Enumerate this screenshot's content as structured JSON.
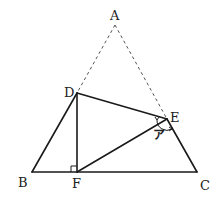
{
  "figure": {
    "type": "geometry-fold-diagram",
    "stroke_color": "#1a1a1a",
    "dashed_color": "#555555",
    "points": {
      "A": {
        "label": "A",
        "x": 115,
        "y": 25
      },
      "B": {
        "label": "B",
        "x": 32,
        "y": 172
      },
      "C": {
        "label": "C",
        "x": 197,
        "y": 172
      },
      "D": {
        "label": "D",
        "x": 77,
        "y": 93
      },
      "E": {
        "label": "E",
        "x": 167,
        "y": 119
      },
      "F": {
        "label": "F",
        "x": 77,
        "y": 172
      }
    },
    "solid_segments": [
      [
        "B",
        "C"
      ],
      [
        "B",
        "D"
      ],
      [
        "D",
        "E"
      ],
      [
        "E",
        "C"
      ],
      [
        "D",
        "F"
      ],
      [
        "F",
        "E"
      ]
    ],
    "dashed_segments": [
      [
        "A",
        "D"
      ],
      [
        "A",
        "E"
      ]
    ],
    "right_angle_marker": {
      "at": "F",
      "between": [
        "D",
        "B"
      ]
    },
    "angle_marks": [
      {
        "at": "E",
        "label": "ア",
        "between": [
          "F",
          "C"
        ]
      }
    ]
  }
}
